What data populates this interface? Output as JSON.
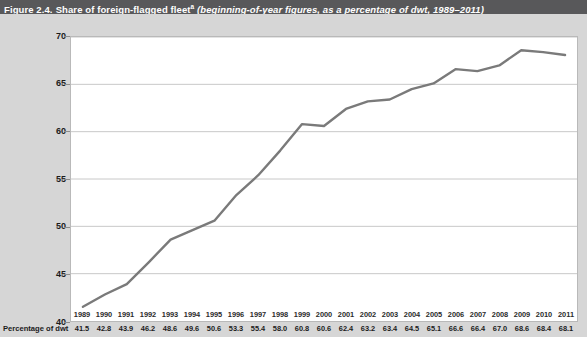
{
  "title": {
    "figure_number": "Figure 2.4.",
    "main": "Share of foreign-flagged fleet",
    "footnote_marker": "a",
    "subtitle": "(beginning-of-year figures, as a percentage of dwt, 1989–2011)"
  },
  "table": {
    "row_label": "Percentage of dwt"
  },
  "colors": {
    "header_bar": "#58585a",
    "page_background": "#d6d6d6",
    "plot_background": "#ffffff",
    "line": "#7a7a7a",
    "gridline": "#c8c8c8",
    "axis": "#8c8c8c"
  },
  "chart_data": {
    "type": "line",
    "xlabel": "",
    "ylabel": "",
    "ylim": [
      40,
      70
    ],
    "yticks": [
      40,
      45,
      50,
      55,
      60,
      65,
      70
    ],
    "ytick_labels": [
      "40",
      "45",
      "50",
      "55",
      "60",
      "65",
      "70"
    ],
    "grid": true,
    "legend": null,
    "categories": [
      "1989",
      "1990",
      "1991",
      "1992",
      "1993",
      "1994",
      "1995",
      "1996",
      "1997",
      "1998",
      "1999",
      "2000",
      "2001",
      "2002",
      "2003",
      "2004",
      "2005",
      "2006",
      "2007",
      "2008",
      "2009",
      "2010",
      "2011"
    ],
    "values": [
      41.5,
      42.8,
      43.9,
      46.2,
      48.6,
      49.6,
      50.6,
      53.3,
      55.4,
      58.0,
      60.8,
      60.6,
      62.4,
      63.2,
      63.4,
      64.5,
      65.1,
      66.6,
      66.4,
      67.0,
      68.6,
      68.4,
      68.1
    ]
  }
}
